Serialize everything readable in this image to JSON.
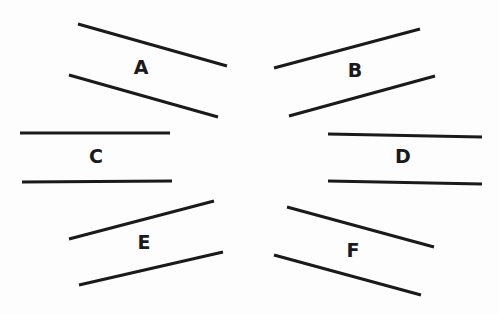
{
  "diagram": {
    "title": "",
    "line_color": "#1a1a1a",
    "background": "#fdfdfd",
    "stroke_width": 3,
    "pairs": [
      {
        "label": "A",
        "label_pos": [
          141,
          68
        ],
        "lines": [
          [
            78,
            24,
            227,
            66
          ],
          [
            69,
            75,
            218,
            117
          ]
        ]
      },
      {
        "label": "B",
        "label_pos": [
          355,
          71
        ],
        "lines": [
          [
            274,
            68,
            420,
            29
          ],
          [
            289,
            116,
            435,
            76
          ]
        ]
      },
      {
        "label": "C",
        "label_pos": [
          96,
          157
        ],
        "lines": [
          [
            20,
            133,
            170,
            133
          ],
          [
            22,
            182,
            172,
            181
          ]
        ]
      },
      {
        "label": "D",
        "label_pos": [
          403,
          157
        ],
        "lines": [
          [
            328,
            134,
            482,
            137
          ],
          [
            328,
            181,
            482,
            184
          ]
        ]
      },
      {
        "label": "E",
        "label_pos": [
          144,
          243
        ],
        "lines": [
          [
            69,
            239,
            214,
            201
          ],
          [
            79,
            285,
            223,
            252
          ]
        ]
      },
      {
        "label": "F",
        "label_pos": [
          353,
          251
        ],
        "lines": [
          [
            287,
            207,
            434,
            247
          ],
          [
            274,
            255,
            421,
            295
          ]
        ]
      }
    ]
  }
}
